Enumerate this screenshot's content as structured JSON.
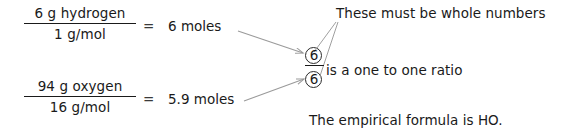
{
  "figure": {
    "ink_color": "#1a1a1a",
    "line_color": "#9a9a9a",
    "background": "#ffffff"
  },
  "calculations": [
    {
      "id": "hydrogen",
      "numerator": "6 g hydrogen",
      "denominator": "1 g/mol",
      "equals": "=",
      "result": "6 moles"
    },
    {
      "id": "oxygen",
      "numerator": "94 g oxygen",
      "denominator": "16 g/mol",
      "equals": "=",
      "result": "5.9 moles"
    }
  ],
  "ratio": {
    "numerator": "6",
    "denominator": "6",
    "caption": "is a one to one ratio"
  },
  "annotations": {
    "whole_numbers_note": "These must be whole numbers",
    "conclusion": "The empirical formula is HO."
  }
}
